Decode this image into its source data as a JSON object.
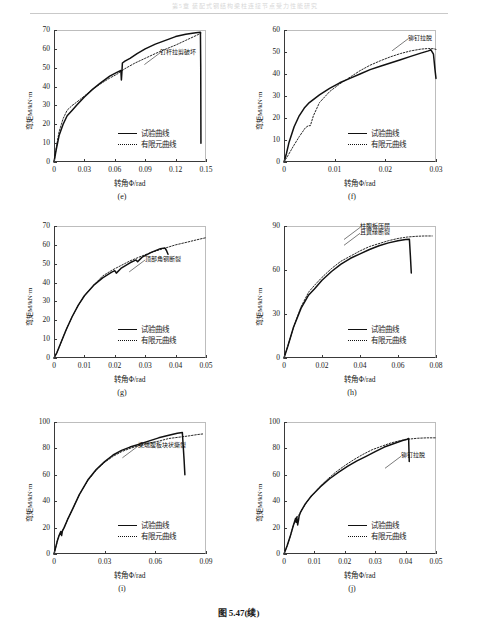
{
  "header": {
    "running_text": "第5章  装配式钢结构梁柱连接节点受力性能研究"
  },
  "caption": "图 5.47(续)",
  "common": {
    "xlabel": "转角Φ/rad",
    "ylabel": "弯矩M/kN·m",
    "legend": [
      {
        "style": "solid",
        "label": "试验曲线"
      },
      {
        "style": "dotted",
        "label": "有限元曲线"
      }
    ]
  },
  "chart_data": [
    {
      "type": "line",
      "tag": "(e)",
      "title": "",
      "xlabel": "转角Φ/rad",
      "ylabel": "弯矩M/kN·m",
      "xlim": [
        0,
        0.15
      ],
      "ylim": [
        0,
        70
      ],
      "xticks": [
        "0",
        "0.03",
        "0.06",
        "0.09",
        "0.12",
        "0.15"
      ],
      "yticks": [
        "0",
        "10",
        "20",
        "30",
        "40",
        "50",
        "60",
        "70"
      ],
      "grid": false,
      "legend_position": "lower-right",
      "annotations": [
        {
          "text": "钉杆拉剪破坏",
          "x": 0.105,
          "y": 58
        }
      ],
      "series": [
        {
          "name": "试验曲线",
          "x": [
            0,
            0.002,
            0.005,
            0.009,
            0.013,
            0.018,
            0.023,
            0.03,
            0.038,
            0.046,
            0.055,
            0.062,
            0.066,
            0.0665,
            0.067,
            0.0675,
            0.07,
            0.075,
            0.082,
            0.09,
            0.1,
            0.11,
            0.12,
            0.13,
            0.14,
            0.1445,
            0.1448,
            0.145
          ],
          "y": [
            0,
            6,
            14,
            20,
            24.5,
            27.5,
            30.5,
            34.5,
            38.5,
            42,
            45.5,
            47.5,
            48.5,
            43.5,
            47.5,
            52.5,
            53.5,
            55,
            57.5,
            60,
            62.5,
            64.5,
            66.5,
            67.8,
            68.6,
            68.8,
            50,
            10
          ]
        },
        {
          "name": "有限元曲线",
          "x": [
            0,
            0.002,
            0.005,
            0.009,
            0.013,
            0.018,
            0.023,
            0.03,
            0.038,
            0.046,
            0.055,
            0.062,
            0.07,
            0.08,
            0.09,
            0.1,
            0.11,
            0.12,
            0.13,
            0.14,
            0.145
          ],
          "y": [
            0,
            7,
            16,
            23,
            27.5,
            30,
            32,
            35,
            38.5,
            41.5,
            44.5,
            46.5,
            49.5,
            52.5,
            55,
            57.5,
            59.8,
            62,
            64.5,
            67,
            68.3
          ]
        }
      ]
    },
    {
      "type": "line",
      "tag": "(f)",
      "title": "",
      "xlabel": "转角Φ/rad",
      "ylabel": "弯矩M/kN·m",
      "xlim": [
        0,
        0.03
      ],
      "ylim": [
        0,
        60
      ],
      "xticks": [
        "0",
        "0.01",
        "0.02",
        "0.03"
      ],
      "yticks": [
        "0",
        "10",
        "20",
        "30",
        "40",
        "50",
        "60"
      ],
      "grid": false,
      "legend_position": "lower-right",
      "annotations": [
        {
          "text": "铆钉拉脱",
          "x": 0.0245,
          "y": 56
        }
      ],
      "series": [
        {
          "name": "试验曲线",
          "x": [
            0,
            0.0005,
            0.001,
            0.002,
            0.003,
            0.004,
            0.005,
            0.007,
            0.009,
            0.011,
            0.013,
            0.015,
            0.017,
            0.019,
            0.021,
            0.023,
            0.025,
            0.027,
            0.0285,
            0.029,
            0.0295,
            0.0298,
            0.03
          ],
          "y": [
            0,
            4,
            9,
            16,
            21,
            24.5,
            27,
            30.5,
            33.5,
            36,
            38,
            40,
            42,
            43.5,
            45,
            46.5,
            48,
            49.5,
            50.5,
            51,
            49,
            42,
            38
          ]
        },
        {
          "name": "有限元曲线",
          "x": [
            0,
            0.0008,
            0.0018,
            0.003,
            0.0042,
            0.0048,
            0.0052,
            0.0058,
            0.007,
            0.009,
            0.011,
            0.013,
            0.015,
            0.017,
            0.019,
            0.021,
            0.023,
            0.025,
            0.027,
            0.0285,
            0.0295,
            0.03
          ],
          "y": [
            0,
            3,
            7,
            11.5,
            15.5,
            16.5,
            16.5,
            21,
            27,
            32,
            35.5,
            38.5,
            41.5,
            44,
            46,
            47.8,
            49.3,
            50.5,
            51.3,
            51.6,
            51.5,
            51.2
          ]
        }
      ]
    },
    {
      "type": "line",
      "tag": "(g)",
      "title": "",
      "xlabel": "转角Φ/rad",
      "ylabel": "弯矩M/kN·m",
      "xlim": [
        0,
        0.05
      ],
      "ylim": [
        0,
        70
      ],
      "xticks": [
        "0",
        "0.01",
        "0.02",
        "0.03",
        "0.04",
        "0.05"
      ],
      "yticks": [
        "0",
        "10",
        "20",
        "30",
        "40",
        "50",
        "60",
        "70"
      ],
      "grid": false,
      "legend_position": "lower-right",
      "annotations": [
        {
          "text": "顶部角钢断裂",
          "x": 0.03,
          "y": 52
        }
      ],
      "series": [
        {
          "name": "试验曲线",
          "x": [
            0,
            0.001,
            0.002,
            0.004,
            0.006,
            0.008,
            0.01,
            0.013,
            0.016,
            0.019,
            0.02,
            0.0205,
            0.022,
            0.025,
            0.027,
            0.0275,
            0.029,
            0.032,
            0.035,
            0.0365,
            0.037,
            0.0375
          ],
          "y": [
            0,
            3,
            7,
            15,
            22,
            28,
            33,
            38.5,
            42.5,
            45.5,
            46.3,
            45,
            47.5,
            50.5,
            52,
            51,
            53.5,
            56,
            58,
            58.3,
            57,
            55
          ]
        },
        {
          "name": "有限元曲线",
          "x": [
            0,
            0.001,
            0.002,
            0.004,
            0.006,
            0.008,
            0.01,
            0.013,
            0.016,
            0.019,
            0.022,
            0.025,
            0.028,
            0.032,
            0.036,
            0.04,
            0.044,
            0.047,
            0.05
          ],
          "y": [
            0,
            3,
            7,
            15,
            22,
            28,
            33,
            38.5,
            43.5,
            46.5,
            49,
            51.5,
            53.5,
            56,
            58,
            60,
            61.5,
            62.7,
            63.8
          ]
        }
      ]
    },
    {
      "type": "line",
      "tag": "(h)",
      "title": "",
      "xlabel": "转角Φ/rad",
      "ylabel": "弯矩M/kN·m",
      "xlim": [
        0,
        0.08
      ],
      "ylim": [
        0,
        90
      ],
      "xticks": [
        "0",
        "0.02",
        "0.04",
        "0.06",
        "0.08"
      ],
      "yticks": [
        "0",
        "30",
        "60",
        "90"
      ],
      "grid": false,
      "legend_position": "lower-right",
      "annotations": [
        {
          "text": "柱腹板压屈",
          "x": 0.04,
          "y": 89
        },
        {
          "text": "且翼缘断裂",
          "x": 0.04,
          "y": 85
        }
      ],
      "series": [
        {
          "name": "试验曲线",
          "x": [
            0,
            0.002,
            0.005,
            0.009,
            0.013,
            0.016,
            0.02,
            0.025,
            0.03,
            0.035,
            0.04,
            0.045,
            0.05,
            0.055,
            0.06,
            0.064,
            0.066,
            0.0665,
            0.067
          ],
          "y": [
            0,
            8,
            21,
            34,
            43,
            47,
            53,
            59,
            64,
            68,
            71,
            74,
            76.5,
            78.5,
            80,
            80.8,
            81,
            70,
            58
          ]
        },
        {
          "name": "有限元曲线",
          "x": [
            0,
            0.002,
            0.005,
            0.009,
            0.013,
            0.016,
            0.02,
            0.025,
            0.03,
            0.035,
            0.04,
            0.045,
            0.05,
            0.055,
            0.06,
            0.065,
            0.07,
            0.074,
            0.078
          ],
          "y": [
            0,
            8,
            21,
            35,
            45,
            49.5,
            55,
            61,
            66,
            69.5,
            73,
            76,
            78,
            80,
            81.5,
            82.5,
            83,
            83.2,
            83.2
          ]
        }
      ]
    },
    {
      "type": "line",
      "tag": "(i)",
      "title": "",
      "xlabel": "转角Φ/rad",
      "ylabel": "弯矩M/kN·m",
      "xlim": [
        0,
        0.09
      ],
      "ylim": [
        0,
        100
      ],
      "xticks": [
        "0",
        "0.03",
        "0.06",
        "0.09"
      ],
      "yticks": [
        "0",
        "20",
        "40",
        "60",
        "80",
        "100"
      ],
      "grid": false,
      "legend_position": "lower-right",
      "annotations": [
        {
          "text": "梁端腹板块状撕裂",
          "x": 0.05,
          "y": 82
        }
      ],
      "series": [
        {
          "name": "试验曲线",
          "x": [
            0,
            0.001,
            0.002,
            0.003,
            0.004,
            0.0045,
            0.005,
            0.006,
            0.008,
            0.011,
            0.015,
            0.02,
            0.025,
            0.03,
            0.035,
            0.04,
            0.045,
            0.05,
            0.056,
            0.062,
            0.068,
            0.073,
            0.076,
            0.0765,
            0.077,
            0.0775
          ],
          "y": [
            0,
            5,
            10,
            14,
            17,
            14,
            17.5,
            20,
            26,
            34,
            45,
            56,
            64,
            70,
            75,
            78.5,
            81,
            83,
            85.5,
            88,
            90,
            91.5,
            92,
            82,
            72,
            60
          ]
        },
        {
          "name": "有限元曲线",
          "x": [
            0,
            0.001,
            0.002,
            0.003,
            0.004,
            0.005,
            0.006,
            0.008,
            0.011,
            0.015,
            0.02,
            0.025,
            0.03,
            0.035,
            0.04,
            0.045,
            0.05,
            0.056,
            0.062,
            0.068,
            0.074,
            0.08,
            0.085,
            0.0885
          ],
          "y": [
            0,
            5,
            10,
            14,
            16.5,
            17.5,
            20,
            26,
            34,
            45,
            55.5,
            63.5,
            69.5,
            74,
            77.5,
            80,
            82,
            84,
            85.5,
            87.5,
            88.5,
            89.5,
            90.5,
            91
          ]
        }
      ]
    },
    {
      "type": "line",
      "tag": "(j)",
      "title": "",
      "xlabel": "转角Φ/rad",
      "ylabel": "弯矩M/kN·m",
      "xlim": [
        0,
        0.05
      ],
      "ylim": [
        0,
        100
      ],
      "xticks": [
        "0",
        "0.01",
        "0.02",
        "0.03",
        "0.04",
        "0.05"
      ],
      "yticks": [
        "0",
        "20",
        "40",
        "60",
        "80",
        "100"
      ],
      "grid": false,
      "legend_position": "lower-right",
      "annotations": [
        {
          "text": "铆钉拉脱",
          "x": 0.0385,
          "y": 74
        }
      ],
      "series": [
        {
          "name": "试验曲线",
          "x": [
            0,
            0.001,
            0.002,
            0.003,
            0.0038,
            0.004,
            0.0042,
            0.0045,
            0.0048,
            0.005,
            0.0055,
            0.007,
            0.009,
            0.012,
            0.015,
            0.018,
            0.021,
            0.024,
            0.027,
            0.03,
            0.033,
            0.036,
            0.039,
            0.0405,
            0.041,
            0.0412
          ],
          "y": [
            0,
            6,
            13,
            21,
            27,
            24,
            28,
            22,
            26,
            29,
            32,
            38,
            44,
            51,
            57,
            62,
            66.5,
            70.5,
            74,
            77.5,
            81,
            83.5,
            86,
            87,
            87.5,
            70
          ]
        },
        {
          "name": "有限元曲线",
          "x": [
            0,
            0.001,
            0.002,
            0.003,
            0.004,
            0.005,
            0.006,
            0.008,
            0.011,
            0.014,
            0.017,
            0.02,
            0.023,
            0.026,
            0.029,
            0.032,
            0.035,
            0.038,
            0.041,
            0.044,
            0.047,
            0.05
          ],
          "y": [
            0,
            6,
            13,
            21,
            27,
            30,
            34,
            41,
            49,
            56,
            62,
            67,
            71.5,
            75.5,
            79,
            81.5,
            84,
            85.8,
            87,
            87.7,
            88,
            88
          ]
        }
      ]
    }
  ]
}
